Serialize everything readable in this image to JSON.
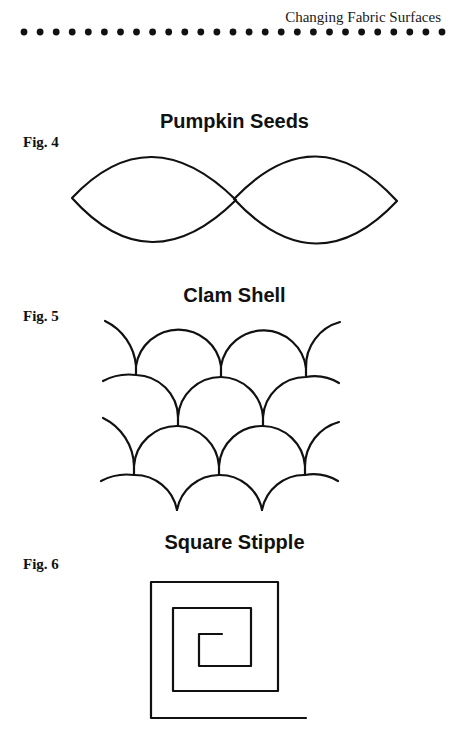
{
  "header": {
    "running_title": "Changing Fabric Surfaces",
    "dot_count": 27
  },
  "figures": [
    {
      "label": "Fig. 4",
      "title": "Pumpkin Seeds"
    },
    {
      "label": "Fig. 5",
      "title": "Clam Shell"
    },
    {
      "label": "Fig. 6",
      "title": "Square Stipple"
    }
  ],
  "colors": {
    "ink": "#111111",
    "paper": "#ffffff"
  }
}
